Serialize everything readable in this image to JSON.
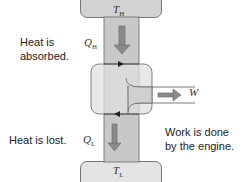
{
  "diagram": {
    "hot_reservoir": {
      "symbol": "T",
      "subscript": "H"
    },
    "cold_reservoir": {
      "symbol": "T",
      "subscript": "L"
    },
    "heat_in": {
      "symbol": "Q",
      "subscript": "H",
      "caption_line1": "Heat is",
      "caption_line2": "absorbed."
    },
    "heat_out": {
      "symbol": "Q",
      "subscript": "L",
      "caption": "Heat is lost."
    },
    "work": {
      "symbol": "W",
      "caption_line1": "Work is done",
      "caption_line2": "by the engine."
    },
    "colors": {
      "column": "#c8c8c8",
      "engine": "#e2e2e2",
      "arrow": "#8a8a8a",
      "outline": "#555555"
    }
  }
}
